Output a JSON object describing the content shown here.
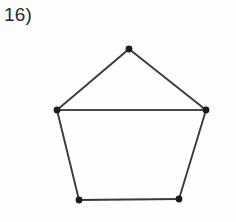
{
  "page": {
    "background_color": "#ffffff",
    "width": 236,
    "height": 222
  },
  "label": {
    "text": "16)",
    "color": "#2b2b2b"
  },
  "figure": {
    "name": "pentagon-with-chord",
    "stroke_color": "#3a3a3a",
    "chord_color": "#4a4a4a",
    "vertex_color": "#1c1c1c",
    "vertex_radius": 3.4,
    "stroke_width": 1.9,
    "chord_width": 2.1,
    "vertices": [
      {
        "id": "top",
        "x": 129,
        "y": 49,
        "label": ""
      },
      {
        "id": "left",
        "x": 57,
        "y": 110,
        "label": ""
      },
      {
        "id": "right",
        "x": 206,
        "y": 110,
        "label": ""
      },
      {
        "id": "bottom-left",
        "x": 79,
        "y": 200,
        "label": ""
      },
      {
        "id": "bottom-right",
        "x": 179,
        "y": 199,
        "label": ""
      }
    ],
    "edges": [
      {
        "id": "edge-top-left",
        "from": "top",
        "to": "left",
        "points": "129,49 57,110"
      },
      {
        "id": "edge-top-right",
        "from": "top",
        "to": "right",
        "points": "129,49 206,110"
      },
      {
        "id": "edge-left-side",
        "from": "left",
        "to": "bottom-left",
        "points": "57,110 79,200"
      },
      {
        "id": "edge-right-side",
        "from": "right",
        "to": "bottom-right",
        "points": "206,110 179,199"
      },
      {
        "id": "edge-bottom",
        "from": "bottom-left",
        "to": "bottom-right",
        "points": "79,200 179,199"
      }
    ],
    "chord": {
      "id": "chord-left-right",
      "from": "left",
      "to": "right",
      "points": "57,110 206,110"
    }
  }
}
